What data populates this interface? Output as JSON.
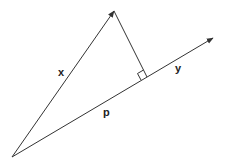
{
  "diagram": {
    "type": "vector-projection",
    "origin": {
      "x": 12,
      "y": 157
    },
    "vector_x": {
      "label": "x",
      "tip": {
        "x": 114,
        "y": 11
      },
      "label_pos": {
        "x": 58,
        "y": 76
      }
    },
    "vector_y": {
      "label": "y",
      "tip": {
        "x": 213,
        "y": 38
      },
      "label_pos": {
        "x": 175,
        "y": 72
      }
    },
    "projection": {
      "label": "p",
      "foot": {
        "x": 147,
        "y": 77
      },
      "label_pos": {
        "x": 103,
        "y": 116
      }
    },
    "right_angle_marker": true,
    "colors": {
      "line": "#333333",
      "background": "#ffffff"
    }
  }
}
